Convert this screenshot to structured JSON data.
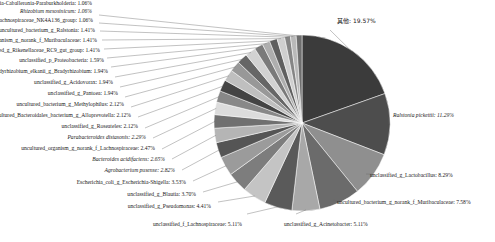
{
  "chart_data": {
    "type": "pie",
    "title": "",
    "legend_position": "callout-labels",
    "label_format": "{name}: {value}%",
    "units": "percent",
    "total": 100.0,
    "categories": [
      "其他",
      "Ralstonia pickettii",
      "unclassified_g_Lactobacillus",
      "uncultured_bacterium_g_norank_f_Muribaculaceae",
      "unclassified_g_Acinetobacter",
      "unclassified_f_Lachnospiraceae",
      "unclassified_g_Pseudomonas",
      "unclassified_g_Blautia",
      "Escherichia_coli_g_Escherichia-Shigella",
      "Agrobacterium pusense",
      "Bacteroides acidifaciens",
      "uncultured_organism_g_norank_f_Lachnospiraceae",
      "Parabacteroides distasonis",
      "unclassified_g_Roseateles",
      "uncultured_Bacteroidales_bacterium_g_Alloprevotella",
      "uncultured_bacterium_g_Methylophilus",
      "unclassified_g_Pantoea",
      "unclassified_g_Acidovorax",
      "Bradyrhizobium_elkanii_g_Bradyrhizobium",
      "unclassified_p_Proteobacteria",
      "unclassified_g_Rikenellaceae_RC9_gut_group",
      "uncultured_organism_g_norank_f_Muribaculaceae",
      "uncultured_bacterium_g_Ralstonia",
      "uncultured_bacterium_g_Lachnospiraceae_NK4A136_group",
      "Rhizobium mesosinicum",
      "unclassified_g_Burkholderia-Caballeronia-Paraburkholderia"
    ],
    "values": [
      19.57,
      11.29,
      8.29,
      7.58,
      5.11,
      5.11,
      4.41,
      3.7,
      3.53,
      2.82,
      2.65,
      2.47,
      2.29,
      2.12,
      2.12,
      2.12,
      1.94,
      1.94,
      1.94,
      1.59,
      1.41,
      1.41,
      1.41,
      1.06,
      1.06,
      1.06
    ],
    "colors": [
      "#3b3b3b",
      "#4d4d4d",
      "#8f8f8f",
      "#6b6b6b",
      "#a8a8a8",
      "#5a5a5a",
      "#c4c4c4",
      "#7d7d7d",
      "#9b9b9b",
      "#555555",
      "#b5b5b5",
      "#707070",
      "#dcdcdc",
      "#888888",
      "#444444",
      "#bfbfbf",
      "#989898",
      "#666666",
      "#d2d2d2",
      "#7a7a7a",
      "#aeaeae",
      "#5f5f5f",
      "#cfcfcf",
      "#858585",
      "#b9b9b9",
      "#6e6e6e"
    ],
    "italic_labels": [
      "Ralstonia pickettii",
      "Parabacteroides distasonis",
      "Bacteroides acidifaciens",
      "Agrobacterium pusense",
      "Rhizobium mesosinicum"
    ],
    "slices": [
      {
        "name": "其他",
        "value": 19.57,
        "label": "其他: 19.57%",
        "color": "#3b3b3b",
        "italic": false,
        "cjk": true
      },
      {
        "name": "Ralstonia pickettii",
        "value": 11.29,
        "label": "Ralstonia pickettii: 11.29%",
        "color": "#4d4d4d",
        "italic": true,
        "cjk": false
      },
      {
        "name": "unclassified_g_Lactobacillus",
        "value": 8.29,
        "label": "unclassified_g_Lactobacillus: 8.29%",
        "color": "#8f8f8f",
        "italic": false,
        "cjk": false
      },
      {
        "name": "uncultured_bacterium_g_norank_f_Muribaculaceae",
        "value": 7.58,
        "label": "uncultured_bacterium_g_norank_f_Muribaculaceae: 7.58%",
        "color": "#6b6b6b",
        "italic": false,
        "cjk": false
      },
      {
        "name": "unclassified_g_Acinetobacter",
        "value": 5.11,
        "label": "unclassified_g_Acinetobacter: 5.11%",
        "color": "#a8a8a8",
        "italic": false,
        "cjk": false
      },
      {
        "name": "unclassified_f_Lachnospiraceae",
        "value": 5.11,
        "label": "unclassified_f_Lachnospiraceae: 5.11%",
        "color": "#5a5a5a",
        "italic": false,
        "cjk": false
      },
      {
        "name": "unclassified_g_Pseudomonas",
        "value": 4.41,
        "label": "unclassified_g_Pseudomonas: 4.41%",
        "color": "#c4c4c4",
        "italic": false,
        "cjk": false
      },
      {
        "name": "unclassified_g_Blautia",
        "value": 3.7,
        "label": "unclassified_g_Blautia: 3.70%",
        "color": "#7d7d7d",
        "italic": false,
        "cjk": false
      },
      {
        "name": "Escherichia_coli_g_Escherichia-Shigella",
        "value": 3.53,
        "label": "Escherichia_coli_g_Escherichia-Shigella: 3.53%",
        "color": "#9b9b9b",
        "italic": false,
        "cjk": false
      },
      {
        "name": "Agrobacterium pusense",
        "value": 2.82,
        "label": "Agrobacterium pusense: 2.82%",
        "color": "#555555",
        "italic": true,
        "cjk": false
      },
      {
        "name": "Bacteroides acidifaciens",
        "value": 2.65,
        "label": "Bacteroides acidifaciens: 2.65%",
        "color": "#b5b5b5",
        "italic": true,
        "cjk": false
      },
      {
        "name": "uncultured_organism_g_norank_f_Lachnospiraceae",
        "value": 2.47,
        "label": "uncultured_organism_g_norank_f_Lachnospiraceae: 2.47%",
        "color": "#707070",
        "italic": false,
        "cjk": false
      },
      {
        "name": "Parabacteroides distasonis",
        "value": 2.29,
        "label": "Parabacteroides distasonis: 2.29%",
        "color": "#dcdcdc",
        "italic": true,
        "cjk": false
      },
      {
        "name": "unclassified_g_Roseateles",
        "value": 2.12,
        "label": "unclassified_g_Roseateles: 2.12%",
        "color": "#888888",
        "italic": false,
        "cjk": false
      },
      {
        "name": "uncultured_Bacteroidales_bacterium_g_Alloprevotella",
        "value": 2.12,
        "label": "uncultured_Bacteroidales_bacterium_g_Alloprevotella: 2.12%",
        "color": "#444444",
        "italic": false,
        "cjk": false
      },
      {
        "name": "uncultured_bacterium_g_Methylophilus",
        "value": 2.12,
        "label": "uncultured_bacterium_g_Methylophilus: 2.12%",
        "color": "#bfbfbf",
        "italic": false,
        "cjk": false
      },
      {
        "name": "unclassified_g_Pantoea",
        "value": 1.94,
        "label": "unclassified_g_Pantoea: 1.94%",
        "color": "#989898",
        "italic": false,
        "cjk": false
      },
      {
        "name": "unclassified_g_Acidovorax",
        "value": 1.94,
        "label": "unclassified_g_Acidovorax: 1.94%",
        "color": "#666666",
        "italic": false,
        "cjk": false
      },
      {
        "name": "Bradyrhizobium_elkanii_g_Bradyrhizobium",
        "value": 1.94,
        "label": "Bradyrhizobium_elkanii_g_Bradyrhizobium: 1.94%",
        "color": "#d2d2d2",
        "italic": false,
        "cjk": false
      },
      {
        "name": "unclassified_p_Proteobacteria",
        "value": 1.59,
        "label": "unclassified_p_Proteobacteria: 1.59%",
        "color": "#7a7a7a",
        "italic": false,
        "cjk": false
      },
      {
        "name": "unclassified_g_Rikenellaceae_RC9_gut_group",
        "value": 1.41,
        "label": "unclassified_g_Rikenellaceae_RC9_gut_group: 1.41%",
        "color": "#aeaeae",
        "italic": false,
        "cjk": false
      },
      {
        "name": "uncultured_organism_g_norank_f_Muribaculaceae",
        "value": 1.41,
        "label": "uncultured_organism_g_norank_f_Muribaculaceae: 1.41%",
        "color": "#5f5f5f",
        "italic": false,
        "cjk": false
      },
      {
        "name": "uncultured_bacterium_g_Ralstonia",
        "value": 1.41,
        "label": "uncultured_bacterium_g_Ralstonia: 1.41%",
        "color": "#cfcfcf",
        "italic": false,
        "cjk": false
      },
      {
        "name": "uncultured_bacterium_g_Lachnospiraceae_NK4A136_group",
        "value": 1.06,
        "label": "uncultured_bacterium_g_Lachnospiraceae_NK4A136_group: 1.06%",
        "color": "#858585",
        "italic": false,
        "cjk": false
      },
      {
        "name": "Rhizobium mesosinicum",
        "value": 1.06,
        "label": "Rhizobium mesosinicum: 1.06%",
        "color": "#b9b9b9",
        "italic": true,
        "cjk": false
      },
      {
        "name": "unclassified_g_Burkholderia-Caballeronia-Paraburkholderia",
        "value": 1.06,
        "label": "unclassified_g_Burkholderia-Caballeronia-Paraburkholderia: 1.06%",
        "color": "#6e6e6e",
        "italic": false,
        "cjk": false
      }
    ]
  },
  "geometry": {
    "cx": 302,
    "cy": 123,
    "r": 88,
    "start_angle_deg": -90,
    "label_anchors": [
      {
        "i": 0,
        "x": 337,
        "y": 23,
        "anchor": "start",
        "elbow_x": 330,
        "elbow_y": 30
      },
      {
        "i": 1,
        "x": 393,
        "y": 117,
        "anchor": "start",
        "elbow_x": 389,
        "elbow_y": 117
      },
      {
        "i": 2,
        "x": 370,
        "y": 177,
        "anchor": "start",
        "elbow_x": 366,
        "elbow_y": 174
      },
      {
        "i": 3,
        "x": 337,
        "y": 204,
        "anchor": "start",
        "elbow_x": 333,
        "elbow_y": 200
      },
      {
        "i": 4,
        "x": 284,
        "y": 226,
        "anchor": "start",
        "elbow_x": 296,
        "elbow_y": 214
      },
      {
        "i": 5,
        "x": 153,
        "y": 226,
        "anchor": "start",
        "elbow_x": 247,
        "elbow_y": 214
      },
      {
        "i": 6,
        "x": 211,
        "y": 208,
        "anchor": "end",
        "elbow_x": 218,
        "elbow_y": 202
      },
      {
        "i": 7,
        "x": 196,
        "y": 196,
        "anchor": "end",
        "elbow_x": 203,
        "elbow_y": 192
      },
      {
        "i": 8,
        "x": 186,
        "y": 184,
        "anchor": "end",
        "elbow_x": 193,
        "elbow_y": 181
      },
      {
        "i": 9,
        "x": 175,
        "y": 172,
        "anchor": "end",
        "elbow_x": 182,
        "elbow_y": 170
      },
      {
        "i": 10,
        "x": 165,
        "y": 161,
        "anchor": "end",
        "elbow_x": 172,
        "elbow_y": 159
      },
      {
        "i": 11,
        "x": 155,
        "y": 150,
        "anchor": "end",
        "elbow_x": 162,
        "elbow_y": 149
      },
      {
        "i": 12,
        "x": 146,
        "y": 139,
        "anchor": "end",
        "elbow_x": 153,
        "elbow_y": 138
      },
      {
        "i": 13,
        "x": 138,
        "y": 128,
        "anchor": "end",
        "elbow_x": 145,
        "elbow_y": 128
      },
      {
        "i": 14,
        "x": 131,
        "y": 117,
        "anchor": "end",
        "elbow_x": 138,
        "elbow_y": 117
      },
      {
        "i": 15,
        "x": 124,
        "y": 106,
        "anchor": "end",
        "elbow_x": 131,
        "elbow_y": 107
      },
      {
        "i": 16,
        "x": 118,
        "y": 95,
        "anchor": "end",
        "elbow_x": 125,
        "elbow_y": 97
      },
      {
        "i": 17,
        "x": 113,
        "y": 84,
        "anchor": "end",
        "elbow_x": 120,
        "elbow_y": 87
      },
      {
        "i": 18,
        "x": 108,
        "y": 73,
        "anchor": "end",
        "elbow_x": 115,
        "elbow_y": 77
      },
      {
        "i": 19,
        "x": 104,
        "y": 62,
        "anchor": "end",
        "elbow_x": 111,
        "elbow_y": 67
      },
      {
        "i": 20,
        "x": 100,
        "y": 52,
        "anchor": "end",
        "elbow_x": 107,
        "elbow_y": 58
      },
      {
        "i": 21,
        "x": 97,
        "y": 42,
        "anchor": "end",
        "elbow_x": 104,
        "elbow_y": 49
      },
      {
        "i": 22,
        "x": 95,
        "y": 32,
        "anchor": "end",
        "elbow_x": 102,
        "elbow_y": 40
      },
      {
        "i": 23,
        "x": 93,
        "y": 22,
        "anchor": "end",
        "elbow_x": 100,
        "elbow_y": 31
      },
      {
        "i": 24,
        "x": 92,
        "y": 13,
        "anchor": "end",
        "elbow_x": 99,
        "elbow_y": 23
      },
      {
        "i": 25,
        "x": 92,
        "y": 5,
        "anchor": "end",
        "elbow_x": 99,
        "elbow_y": 15
      }
    ]
  }
}
